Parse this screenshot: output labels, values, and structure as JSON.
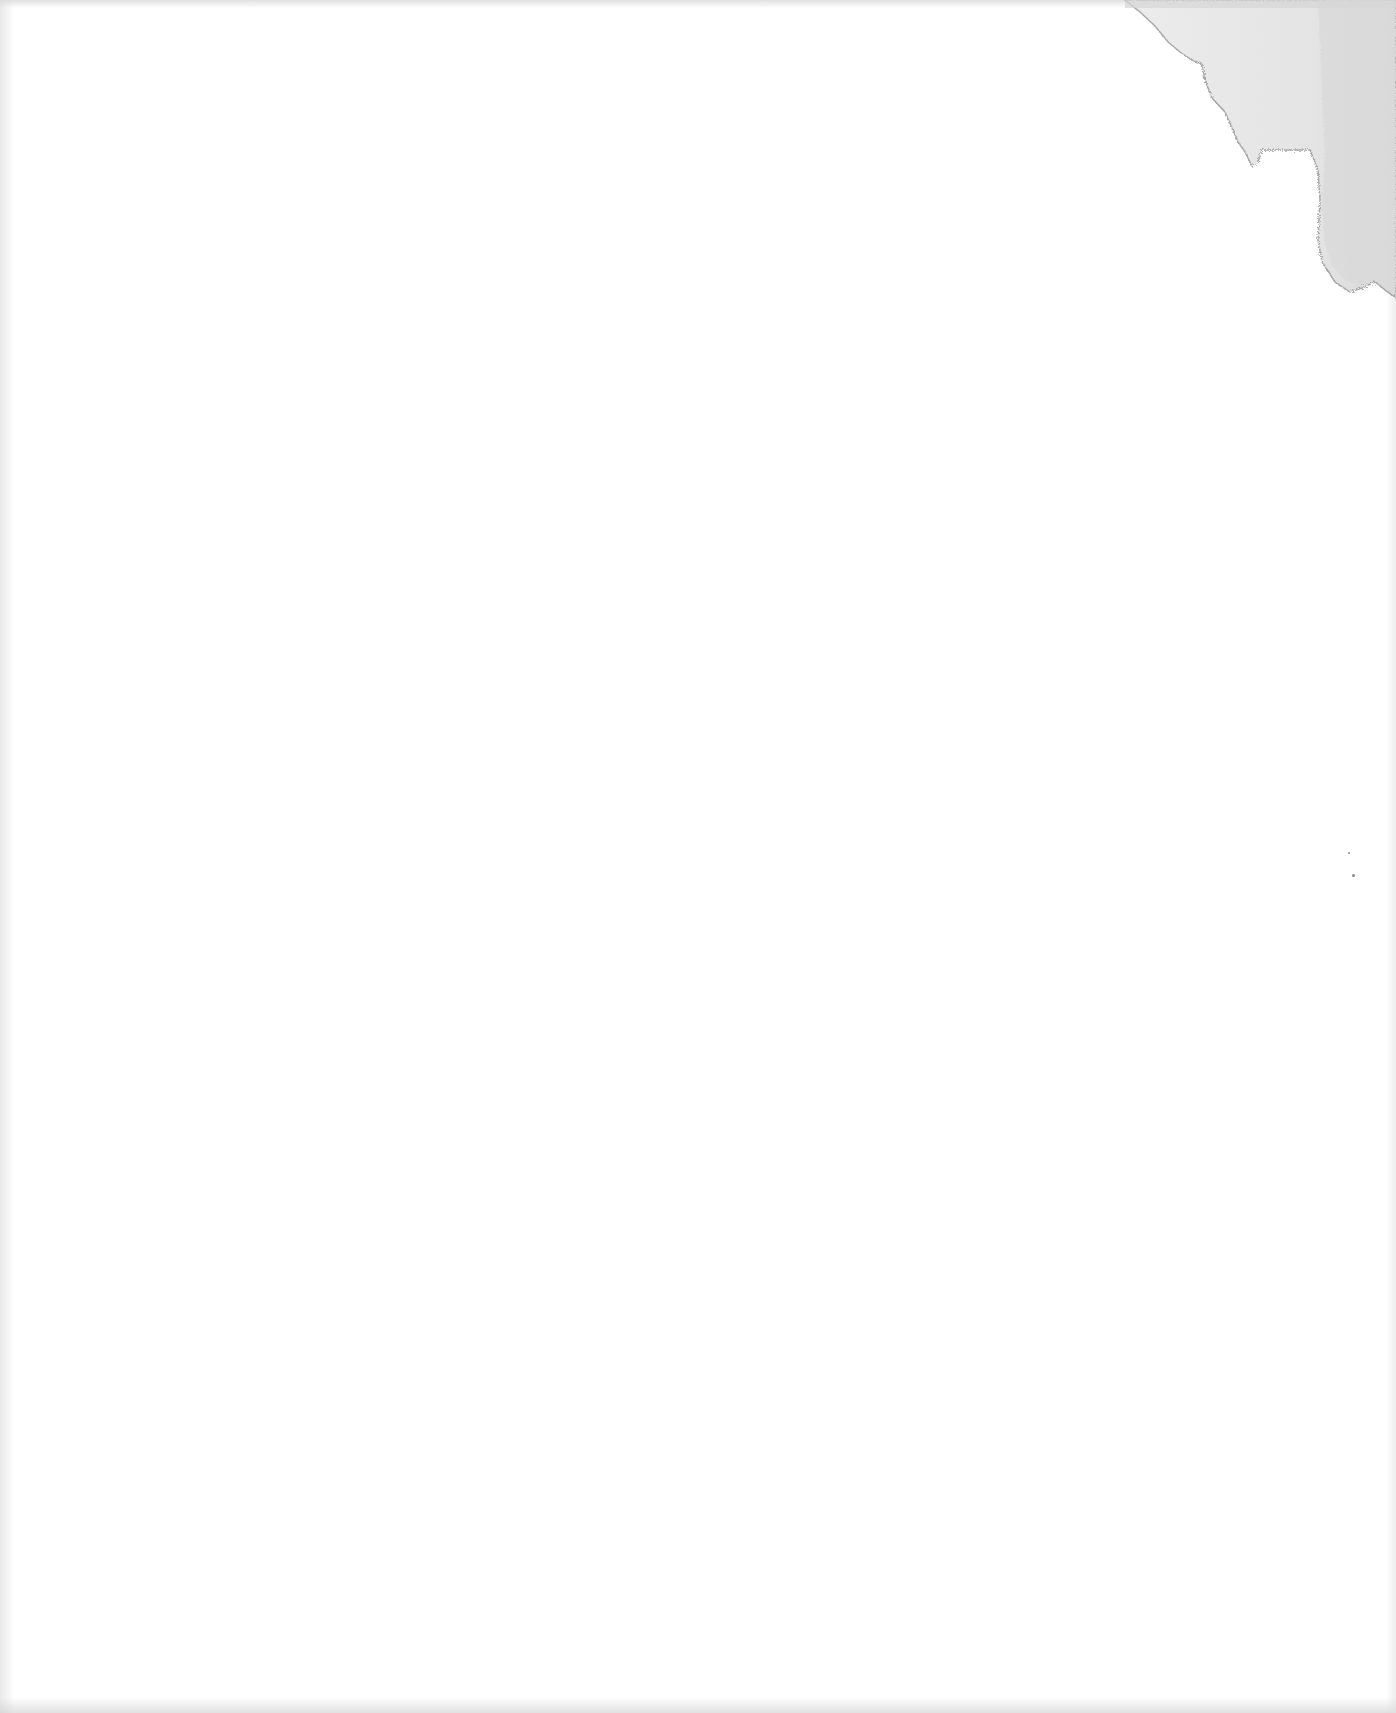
{
  "document": {
    "type": "blank-scanned-page",
    "text": ""
  },
  "colors": {
    "paper": "#ffffff",
    "stain_fill": "#e6e6e6",
    "stain_inner": "#dcdcdc",
    "stain_edge": "#9a9a9a",
    "speck": "#8a8a8a"
  },
  "features": {
    "water_stain": {
      "position": "top-right corner",
      "present": true
    },
    "specks": [
      {
        "x": 1348,
        "y": 852
      },
      {
        "x": 1352,
        "y": 874
      }
    ]
  }
}
